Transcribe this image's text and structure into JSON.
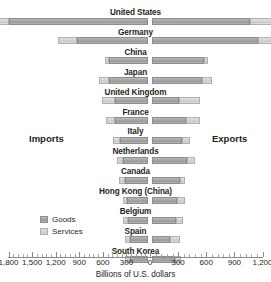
{
  "chart_data": {
    "type": "bar",
    "subtype": "bidirectional-stacked-bar",
    "title": "",
    "xlabel": "Billions of U.S. dollars",
    "ylabel": "",
    "left_direction_label": "Imports",
    "right_direction_label": "Exports",
    "legend_position": "left-inside",
    "grid": false,
    "axis_left_max": 1800,
    "axis_right_max": 1200,
    "tick_interval": 300,
    "minor_tick_interval": 60,
    "tick_labels_left": [
      "1,800",
      "1,500",
      "1,200",
      "900",
      "600",
      "300"
    ],
    "tick_labels_right": [
      "300",
      "600",
      "900",
      "1,200"
    ],
    "zero_label": "0",
    "series": [
      {
        "name": "Goods",
        "color": "#a6a6a6"
      },
      {
        "name": "Services",
        "color": "#d2d2d2"
      }
    ],
    "categories": [
      "United States",
      "Germany",
      "China",
      "Japan",
      "United Kingdom",
      "France",
      "Italy",
      "Netherlands",
      "Canada",
      "Hong Kong (China)",
      "Belgium",
      "Spain",
      "South Korea"
    ],
    "rows": [
      {
        "country": "United States",
        "imports_goods": 1770,
        "imports_services": 330,
        "exports_goods": 1050,
        "exports_services": 490
      },
      {
        "country": "Germany",
        "imports_goods": 900,
        "imports_services": 250,
        "exports_goods": 1130,
        "exports_services": 200
      },
      {
        "country": "China",
        "imports_goods": 500,
        "imports_services": 45,
        "exports_goods": 550,
        "exports_services": 50
      },
      {
        "country": "Japan",
        "imports_goods": 490,
        "imports_services": 135,
        "exports_goods": 530,
        "exports_services": 110
      },
      {
        "country": "United Kingdom",
        "imports_goods": 425,
        "imports_services": 155,
        "exports_goods": 285,
        "exports_services": 230
      },
      {
        "country": "France",
        "imports_goods": 420,
        "imports_services": 120,
        "exports_goods": 360,
        "exports_services": 150
      },
      {
        "country": "Italy",
        "imports_goods": 350,
        "imports_services": 90,
        "exports_goods": 320,
        "exports_services": 80
      },
      {
        "country": "Netherlands",
        "imports_goods": 320,
        "imports_services": 80,
        "exports_goods": 370,
        "exports_services": 90
      },
      {
        "country": "Canada",
        "imports_goods": 290,
        "imports_services": 75,
        "exports_goods": 300,
        "exports_services": 55
      },
      {
        "country": "Hong Kong (China)",
        "imports_goods": 270,
        "imports_services": 45,
        "exports_goods": 265,
        "exports_services": 90
      },
      {
        "country": "Belgium",
        "imports_goods": 250,
        "imports_services": 65,
        "exports_goods": 260,
        "exports_services": 70
      },
      {
        "country": "Spain",
        "imports_goods": 230,
        "imports_services": 60,
        "exports_goods": 195,
        "exports_services": 105
      },
      {
        "country": "South Korea",
        "imports_goods": 225,
        "imports_services": 70,
        "exports_goods": 245,
        "exports_services": 60
      }
    ]
  },
  "legend": {
    "items": [
      {
        "label": "Goods",
        "key": "goods"
      },
      {
        "label": "Services",
        "key": "services"
      }
    ]
  }
}
